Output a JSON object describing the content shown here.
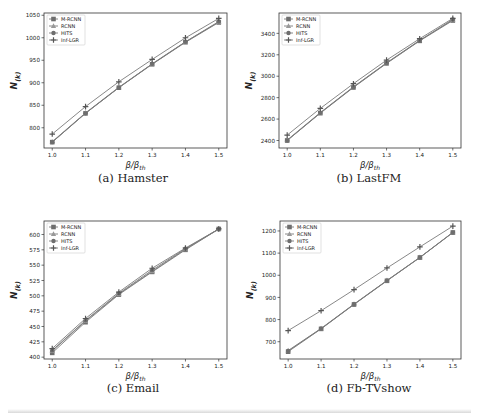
{
  "chart_data": [
    {
      "id": "a",
      "type": "line",
      "caption": "(a) Hamster",
      "xlabel": "β/β_th",
      "ylabel": "N(k)",
      "x": [
        1.0,
        1.1,
        1.2,
        1.3,
        1.4,
        1.5
      ],
      "xticks": [
        "1.0",
        "1.1",
        "1.2",
        "1.3",
        "1.4",
        "1.5"
      ],
      "yticks": [
        800,
        850,
        900,
        950,
        1000,
        1050
      ],
      "ylim": [
        755,
        1055
      ],
      "grid": false,
      "legend_position": "upper left",
      "series": [
        {
          "name": "M-RCNN",
          "marker": "square",
          "values": [
            768,
            832,
            889,
            941,
            990,
            1034
          ]
        },
        {
          "name": "RCNN",
          "marker": "triangle",
          "values": [
            769,
            833,
            890,
            942,
            991,
            1035
          ]
        },
        {
          "name": "HITS",
          "marker": "circle",
          "values": [
            768,
            832,
            889,
            942,
            991,
            1036
          ]
        },
        {
          "name": "Inf-LGR",
          "marker": "plus",
          "values": [
            786,
            847,
            902,
            952,
            1000,
            1043
          ]
        }
      ]
    },
    {
      "id": "b",
      "type": "line",
      "caption": "(b) LastFM",
      "xlabel": "β/β_th",
      "ylabel": "N(k)",
      "x": [
        1.0,
        1.1,
        1.2,
        1.3,
        1.4,
        1.5
      ],
      "xticks": [
        "1.0",
        "1.1",
        "1.2",
        "1.3",
        "1.4",
        "1.5"
      ],
      "yticks": [
        2400,
        2600,
        2800,
        3000,
        3200,
        3400
      ],
      "ylim": [
        2330,
        3590
      ],
      "grid": false,
      "legend_position": "upper left",
      "series": [
        {
          "name": "M-RCNN",
          "marker": "square",
          "values": [
            2400,
            2655,
            2895,
            3120,
            3330,
            3520
          ]
        },
        {
          "name": "RCNN",
          "marker": "triangle",
          "values": [
            2405,
            2660,
            2900,
            3125,
            3335,
            3525
          ]
        },
        {
          "name": "HITS",
          "marker": "circle",
          "values": [
            2400,
            2658,
            2898,
            3122,
            3332,
            3530
          ]
        },
        {
          "name": "Inf-LGR",
          "marker": "plus",
          "values": [
            2450,
            2700,
            2930,
            3150,
            3350,
            3540
          ]
        }
      ]
    },
    {
      "id": "c",
      "type": "line",
      "caption": "(c) Email",
      "xlabel": "β/β_th",
      "ylabel": "N(k)",
      "x": [
        1.0,
        1.1,
        1.2,
        1.3,
        1.4,
        1.5
      ],
      "xticks": [
        "1.0",
        "1.1",
        "1.2",
        "1.3",
        "1.4",
        "1.5"
      ],
      "yticks": [
        400,
        425,
        450,
        475,
        500,
        525,
        550,
        575,
        600
      ],
      "ylim": [
        397,
        622
      ],
      "grid": false,
      "legend_position": "upper left",
      "series": [
        {
          "name": "M-RCNN",
          "marker": "square",
          "values": [
            407,
            457,
            502,
            539,
            575,
            609
          ]
        },
        {
          "name": "RCNN",
          "marker": "triangle",
          "values": [
            410,
            459,
            503,
            540,
            576,
            609
          ]
        },
        {
          "name": "HITS",
          "marker": "circle",
          "values": [
            411,
            460,
            504,
            542,
            577,
            609
          ]
        },
        {
          "name": "Inf-LGR",
          "marker": "plus",
          "values": [
            414,
            463,
            506,
            545,
            578,
            609
          ]
        }
      ]
    },
    {
      "id": "d",
      "type": "line",
      "caption": "(d) Fb-TVshow",
      "xlabel": "β/β_th",
      "ylabel": "N(k)",
      "x": [
        1.0,
        1.1,
        1.2,
        1.3,
        1.4,
        1.5
      ],
      "xticks": [
        "1.0",
        "1.1",
        "1.2",
        "1.3",
        "1.4",
        "1.5"
      ],
      "yticks": [
        700,
        800,
        900,
        1000,
        1100,
        1200
      ],
      "ylim": [
        622,
        1245
      ],
      "grid": false,
      "legend_position": "upper left",
      "series": [
        {
          "name": "M-RCNN",
          "marker": "square",
          "values": [
            655,
            758,
            868,
            975,
            1080,
            1193
          ]
        },
        {
          "name": "RCNN",
          "marker": "triangle",
          "values": [
            660,
            760,
            870,
            977,
            1081,
            1194
          ]
        },
        {
          "name": "HITS",
          "marker": "circle",
          "values": [
            658,
            759,
            869,
            976,
            1080,
            1193
          ]
        },
        {
          "name": "Inf-LGR",
          "marker": "plus",
          "values": [
            750,
            840,
            935,
            1033,
            1128,
            1222
          ]
        }
      ]
    }
  ],
  "style": {
    "line_color": "#7a7a7a",
    "marker_color": "#6e6e6e",
    "frame_color": "#333333",
    "text_color": "#222222"
  }
}
